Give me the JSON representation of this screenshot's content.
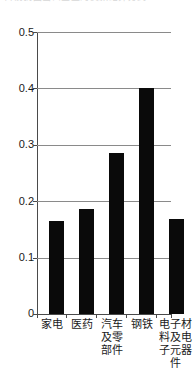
{
  "page": {
    "top_clipped_line": "目前我国出口企业的货款结算方式"
  },
  "chart_data": {
    "type": "bar",
    "title": "",
    "subtitle": "",
    "xlabel": "",
    "ylabel": "",
    "categories": [
      "家电",
      "医药",
      "汽车及零部件",
      "钢铁",
      "电子材料及电子元器件"
    ],
    "values": [
      0.165,
      0.186,
      0.285,
      0.4,
      0.168
    ],
    "series": [
      {
        "name": "",
        "values": [
          0.165,
          0.186,
          0.285,
          0.4,
          0.168
        ]
      }
    ],
    "ylim": [
      0,
      0.5
    ],
    "ytick_values": [
      0,
      0.1,
      0.2,
      0.3,
      0.4,
      0.5
    ],
    "ytick_labels": [
      "0",
      "0.1",
      "0.2",
      "0.3",
      "0.4",
      "0.5"
    ],
    "grid": true,
    "grid_axis": "y",
    "legend": false,
    "legend_position": "none",
    "bar_color": "#0a0a0a",
    "gridline_color": "#8a8a8a",
    "axis_color": "#4a4a4a",
    "background_color": "#ffffff"
  }
}
